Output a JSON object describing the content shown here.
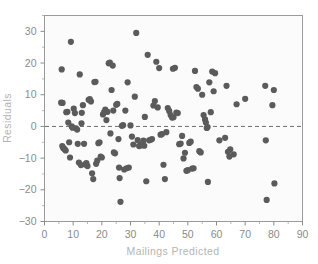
{
  "chart_data": {
    "type": "scatter",
    "title": "",
    "xlabel": "Mailings Predicted",
    "ylabel": "Residuals",
    "xlim": [
      0,
      90
    ],
    "ylim": [
      -30,
      35
    ],
    "xticks": [
      0,
      10,
      20,
      30,
      40,
      50,
      60,
      70,
      80,
      90
    ],
    "xtick_labels": [
      "0",
      "10",
      "20",
      "30",
      "40",
      "50",
      "60",
      "70",
      "80",
      "90"
    ],
    "yticks": [
      -30,
      -20,
      -10,
      0,
      10,
      20,
      30
    ],
    "ytick_labels": [
      "−30",
      "−20",
      "−10",
      "0",
      "10",
      "20",
      "30"
    ],
    "minor_xticks": [
      5,
      15,
      25,
      35,
      45,
      55,
      65,
      75,
      85
    ],
    "minor_yticks": [
      -25,
      -15,
      -5,
      5,
      15,
      25,
      35
    ],
    "grid": false,
    "legend": null,
    "reference_line": {
      "type": "horizontal",
      "y": 0,
      "style": "dashed"
    },
    "marker_color": "#5b5b5b",
    "marker_size": 3.1,
    "background_color": "#fbfbfb",
    "frame_color": "#9a9a9a",
    "label_color": "#b4b4b4",
    "tick_color": "#8b8b8b",
    "n_points": 148,
    "points": [
      [
        5.8,
        7.5
      ],
      [
        6.3,
        7.4
      ],
      [
        6.0,
        18.0
      ],
      [
        6.2,
        -6.2
      ],
      [
        6.5,
        -6.8
      ],
      [
        6.8,
        -7.0
      ],
      [
        7.1,
        -7.3
      ],
      [
        7.4,
        -7.6
      ],
      [
        7.6,
        4.5
      ],
      [
        8.0,
        4.6
      ],
      [
        8.3,
        1.2
      ],
      [
        8.6,
        -5.0
      ],
      [
        8.9,
        -9.8
      ],
      [
        9.2,
        26.7
      ],
      [
        9.5,
        0.0
      ],
      [
        9.8,
        -0.4
      ],
      [
        10.2,
        5.6
      ],
      [
        10.6,
        4.2
      ],
      [
        11.0,
        -0.6
      ],
      [
        11.4,
        -1.0
      ],
      [
        11.6,
        -5.5
      ],
      [
        12.0,
        -11.4
      ],
      [
        12.3,
        16.4
      ],
      [
        12.7,
        -12.2
      ],
      [
        13.0,
        4.3
      ],
      [
        13.4,
        6.7
      ],
      [
        13.8,
        -5.5
      ],
      [
        14.2,
        -12.0
      ],
      [
        14.6,
        -11.6
      ],
      [
        15.0,
        -12.5
      ],
      [
        15.4,
        8.4
      ],
      [
        15.8,
        8.6
      ],
      [
        16.2,
        7.9
      ],
      [
        16.6,
        -14.8
      ],
      [
        17.0,
        -16.6
      ],
      [
        17.4,
        14.0
      ],
      [
        17.8,
        14.1
      ],
      [
        18.0,
        -11.8
      ],
      [
        18.4,
        -10.8
      ],
      [
        18.8,
        -5.3
      ],
      [
        19.2,
        -5.0
      ],
      [
        19.6,
        -9.5
      ],
      [
        20.0,
        -9.8
      ],
      [
        20.4,
        3.8
      ],
      [
        20.8,
        4.5
      ],
      [
        21.2,
        5.3
      ],
      [
        21.6,
        2.0
      ],
      [
        22.0,
        4.6
      ],
      [
        22.4,
        19.9
      ],
      [
        22.8,
        20.1
      ],
      [
        23.0,
        -2.2
      ],
      [
        23.4,
        11.5
      ],
      [
        23.8,
        19.2
      ],
      [
        24.2,
        -8.2
      ],
      [
        24.6,
        -8.5
      ],
      [
        25.0,
        6.8
      ],
      [
        25.4,
        7.1
      ],
      [
        25.8,
        -4.0
      ],
      [
        26.0,
        -13.0
      ],
      [
        26.2,
        -16.3
      ],
      [
        26.5,
        -23.8
      ],
      [
        27.0,
        0.2
      ],
      [
        27.4,
        0.4
      ],
      [
        27.8,
        -13.6
      ],
      [
        28.2,
        5.0
      ],
      [
        28.6,
        -13.2
      ],
      [
        29.0,
        13.9
      ],
      [
        29.4,
        -13.0
      ],
      [
        30.0,
        0.3
      ],
      [
        30.5,
        -3.2
      ],
      [
        31.0,
        -5.7
      ],
      [
        31.5,
        9.4
      ],
      [
        32.0,
        29.5
      ],
      [
        32.5,
        -4.3
      ],
      [
        33.0,
        -6.2
      ],
      [
        33.5,
        -6.0
      ],
      [
        34.0,
        -5.6
      ],
      [
        34.5,
        -4.5
      ],
      [
        35.0,
        3.0
      ],
      [
        35.5,
        -17.3
      ],
      [
        36.0,
        22.6
      ],
      [
        36.5,
        -4.4
      ],
      [
        37.0,
        -4.2
      ],
      [
        37.5,
        -4.0
      ],
      [
        38.0,
        6.6
      ],
      [
        38.5,
        8.0
      ],
      [
        39.0,
        20.4
      ],
      [
        39.5,
        6.0
      ],
      [
        40.0,
        18.4
      ],
      [
        40.5,
        -2.6
      ],
      [
        41.0,
        -2.4
      ],
      [
        41.5,
        -12.1
      ],
      [
        42.0,
        -16.6
      ],
      [
        42.5,
        -1.8
      ],
      [
        43.0,
        5.8
      ],
      [
        43.5,
        4.9
      ],
      [
        44.0,
        3.6
      ],
      [
        44.5,
        2.8
      ],
      [
        45.0,
        2.9
      ],
      [
        45.5,
        18.5
      ],
      [
        46.0,
        4.4
      ],
      [
        46.5,
        4.2
      ],
      [
        47.0,
        -5.6
      ],
      [
        47.5,
        -5.4
      ],
      [
        48.0,
        -3.0
      ],
      [
        48.5,
        -10.1
      ],
      [
        49.0,
        -8.3
      ],
      [
        49.5,
        -14.0
      ],
      [
        50.0,
        -13.8
      ],
      [
        50.5,
        -5.2
      ],
      [
        51.0,
        -4.8
      ],
      [
        51.5,
        -13.3
      ],
      [
        52.0,
        -13.2
      ],
      [
        52.5,
        17.5
      ],
      [
        53.0,
        12.4
      ],
      [
        53.5,
        11.9
      ],
      [
        54.0,
        -7.8
      ],
      [
        54.5,
        -8.2
      ],
      [
        55.0,
        10.0
      ],
      [
        55.5,
        3.6
      ],
      [
        56.0,
        2.2
      ],
      [
        56.3,
        1.2
      ],
      [
        56.6,
        -0.5
      ],
      [
        56.9,
        -0.2
      ],
      [
        57.0,
        -17.5
      ],
      [
        57.5,
        13.9
      ],
      [
        58.0,
        4.5
      ],
      [
        58.5,
        17.3
      ],
      [
        59.0,
        11.1
      ],
      [
        59.5,
        16.8
      ],
      [
        61.0,
        -4.4
      ],
      [
        63.0,
        -3.6
      ],
      [
        63.5,
        12.8
      ],
      [
        64.0,
        -8.0
      ],
      [
        64.5,
        -9.5
      ],
      [
        64.8,
        -7.2
      ],
      [
        66.0,
        -8.8
      ],
      [
        67.0,
        7.0
      ],
      [
        70.0,
        8.7
      ],
      [
        77.0,
        12.8
      ],
      [
        77.2,
        -4.4
      ],
      [
        77.5,
        -23.2
      ],
      [
        79.5,
        6.7
      ],
      [
        80.0,
        11.5
      ],
      [
        80.2,
        -18.0
      ],
      [
        24.0,
        5.0
      ],
      [
        34.8,
        -6.1
      ],
      [
        44.8,
        18.2
      ],
      [
        12.9,
        1.0
      ]
    ]
  }
}
